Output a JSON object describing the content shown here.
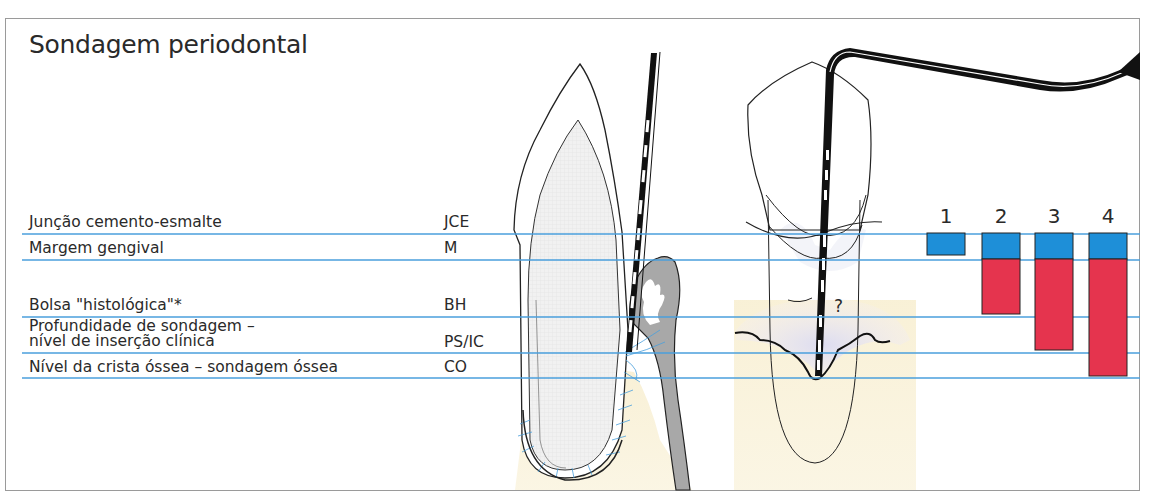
{
  "title": "Sondagem periodontal",
  "levels": [
    {
      "label": "Junção cemento-esmalte",
      "abbr": "JCE",
      "y": 234
    },
    {
      "label": "Margem gengival",
      "abbr": "M",
      "y": 260
    },
    {
      "label": "Bolsa \"histológica\"*",
      "abbr": "BH",
      "y": 317
    },
    {
      "label_line1": "Profundidade de sondagem –",
      "label_line2": "nível de inserção clínica",
      "abbr": "PS/IC",
      "y": 353
    },
    {
      "label": "Nível da crista óssea – sondagem óssea",
      "abbr": "CO",
      "y": 378
    }
  ],
  "columns": [
    {
      "number": "1",
      "blue": "JCE–M",
      "red": null
    },
    {
      "number": "2",
      "blue": "JCE–M",
      "red": "M–BH"
    },
    {
      "number": "3",
      "blue": "JCE–M",
      "red": "M–PS/IC"
    },
    {
      "number": "4",
      "blue": "JCE–M",
      "red": "M–CO"
    }
  ],
  "annotation": "?",
  "colors": {
    "line": "#4a9fdc",
    "blue_bar": "#1e8fd8",
    "red_bar": "#e5344e",
    "bone": "#f8efd2",
    "gingiva": "#a8a8a8",
    "pocket": "#e4e1f0"
  }
}
